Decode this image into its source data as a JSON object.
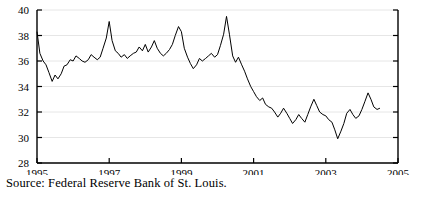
{
  "chart_data": {
    "type": "line",
    "title": "",
    "subtitle": "",
    "xlabel": "",
    "ylabel": "",
    "xlim": [
      1995,
      2005
    ],
    "ylim": [
      28,
      40
    ],
    "xticks": [
      1995,
      1997,
      1999,
      2001,
      2003,
      2005
    ],
    "xticklabels": [
      "1995",
      "1997",
      "1999",
      "2001",
      "2003",
      "2005"
    ],
    "yticks": [
      28,
      30,
      32,
      34,
      36,
      38,
      40
    ],
    "yticklabels": [
      "28",
      "30",
      "32",
      "34",
      "36",
      "38",
      "40"
    ],
    "grid": "horizontal",
    "grid_color": "#e6e6e6",
    "line_color": "#000000",
    "line_width": 1.0,
    "legend": "none",
    "series": [
      {
        "name": "series-1",
        "x": [
          1995.0,
          1995.08,
          1995.17,
          1995.25,
          1995.33,
          1995.42,
          1995.5,
          1995.58,
          1995.67,
          1995.75,
          1995.83,
          1995.92,
          1996.0,
          1996.08,
          1996.17,
          1996.25,
          1996.33,
          1996.42,
          1996.5,
          1996.58,
          1996.67,
          1996.75,
          1996.83,
          1996.92,
          1997.0,
          1997.08,
          1997.17,
          1997.25,
          1997.33,
          1997.42,
          1997.5,
          1997.58,
          1997.67,
          1997.75,
          1997.83,
          1997.92,
          1998.0,
          1998.08,
          1998.17,
          1998.25,
          1998.33,
          1998.42,
          1998.5,
          1998.58,
          1998.67,
          1998.75,
          1998.83,
          1998.92,
          1999.0,
          1999.08,
          1999.17,
          1999.25,
          1999.33,
          1999.42,
          1999.5,
          1999.58,
          1999.67,
          1999.75,
          1999.83,
          1999.92,
          2000.0,
          2000.08,
          2000.17,
          2000.25,
          2000.33,
          2000.42,
          2000.5,
          2000.58,
          2000.67,
          2000.75,
          2000.83,
          2000.92,
          2001.0,
          2001.08,
          2001.17,
          2001.25,
          2001.33,
          2001.42,
          2001.5,
          2001.58,
          2001.67,
          2001.75,
          2001.83,
          2001.92,
          2002.0,
          2002.08,
          2002.17,
          2002.25,
          2002.33,
          2002.42,
          2002.5,
          2002.58,
          2002.67,
          2002.75,
          2002.83,
          2002.92,
          2003.0,
          2003.08,
          2003.17,
          2003.25,
          2003.33,
          2003.42,
          2003.5,
          2003.58,
          2003.67,
          2003.75,
          2003.83,
          2003.92,
          2004.0,
          2004.08,
          2004.17,
          2004.25,
          2004.33,
          2004.42,
          2004.5
        ],
        "y": [
          38.3,
          36.6,
          36.0,
          35.7,
          35.1,
          34.4,
          34.9,
          34.6,
          35.0,
          35.6,
          35.7,
          36.1,
          36.0,
          36.4,
          36.2,
          36.0,
          35.9,
          36.1,
          36.5,
          36.3,
          36.1,
          36.3,
          37.0,
          37.8,
          39.1,
          37.6,
          36.8,
          36.6,
          36.3,
          36.5,
          36.2,
          36.4,
          36.6,
          36.7,
          37.1,
          36.8,
          37.3,
          36.7,
          37.1,
          37.6,
          37.0,
          36.6,
          36.4,
          36.6,
          36.9,
          37.3,
          38.0,
          38.7,
          38.3,
          37.0,
          36.3,
          35.8,
          35.4,
          35.7,
          36.2,
          36.0,
          36.2,
          36.4,
          36.6,
          36.3,
          36.5,
          37.2,
          38.1,
          39.5,
          38.1,
          36.4,
          35.9,
          36.3,
          35.7,
          35.2,
          34.6,
          34.0,
          33.6,
          33.2,
          32.9,
          33.1,
          32.6,
          32.4,
          32.3,
          32.0,
          31.6,
          31.9,
          32.3,
          31.9,
          31.5,
          31.1,
          31.4,
          31.8,
          31.5,
          31.2,
          31.8,
          32.4,
          33.0,
          32.5,
          32.0,
          31.8,
          31.7,
          31.4,
          31.2,
          30.6,
          29.9,
          30.5,
          31.1,
          31.9,
          32.2,
          31.8,
          31.5,
          31.7,
          32.2,
          32.8,
          33.5,
          33.0,
          32.4,
          32.2,
          32.3
        ]
      }
    ]
  },
  "axes": {
    "y_tick_labels": [
      "40",
      "38",
      "36",
      "34",
      "32",
      "30",
      "28"
    ],
    "x_tick_labels": [
      "1995",
      "1997",
      "1999",
      "2001",
      "2003",
      "2005"
    ]
  },
  "caption": {
    "source_text": "Source: Federal Reserve Bank of St. Louis."
  }
}
